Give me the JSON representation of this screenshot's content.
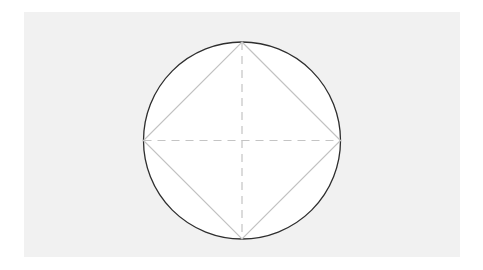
{
  "diagram": {
    "type": "geometry",
    "canvas": {
      "width": 483,
      "height": 270
    },
    "colors": {
      "page_background": "#ffffff",
      "panel_background": "#f1f1f1",
      "circle_fill": "#ffffff",
      "circle_stroke": "#2e2e2e",
      "square_stroke": "#c2c2c2",
      "diameter_stroke": "#c4c4c4"
    },
    "circle": {
      "cx": 242,
      "cy": 140.5,
      "r": 98.5,
      "stroke_width": 1.3
    },
    "inscribed_square": {
      "vertices": [
        {
          "name": "top",
          "x": 242,
          "y": 42
        },
        {
          "name": "right",
          "x": 340.5,
          "y": 140.5
        },
        {
          "name": "bottom",
          "x": 242,
          "y": 239
        },
        {
          "name": "left",
          "x": 143.5,
          "y": 140.5
        }
      ],
      "stroke_width": 1.2
    },
    "diameters": [
      {
        "name": "horizontal",
        "x1": 143.5,
        "y1": 140.5,
        "x2": 340.5,
        "y2": 140.5,
        "dash": "8,6"
      },
      {
        "name": "vertical",
        "x1": 242,
        "y1": 42,
        "x2": 242,
        "y2": 239,
        "dash": "8,6"
      }
    ]
  }
}
